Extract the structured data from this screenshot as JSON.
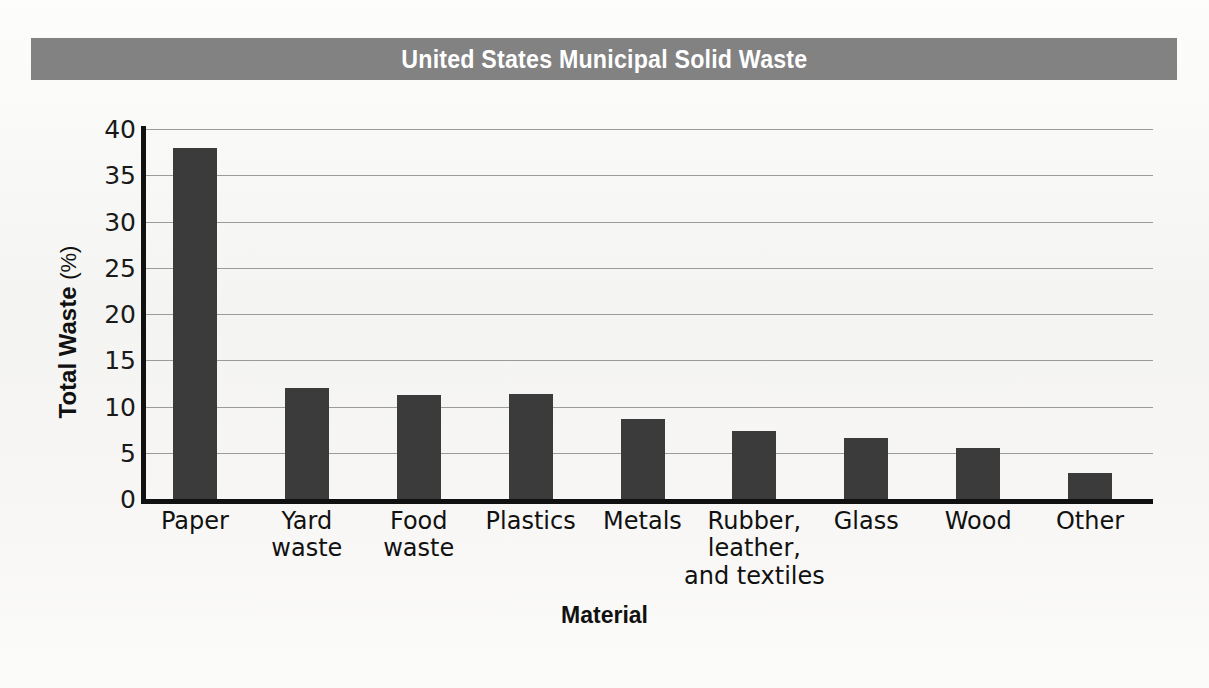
{
  "banner": {
    "title": "United States Municipal Solid Waste",
    "background_color": "#828282",
    "text_color": "#ffffff"
  },
  "axis_titles": {
    "y_main": "Total Waste",
    "y_unit": "(%)",
    "x": "Material"
  },
  "chart_data": {
    "type": "bar",
    "title": "United States Municipal Solid Waste",
    "xlabel": "Material",
    "ylabel": "Total Waste (%)",
    "ylim": [
      0,
      40
    ],
    "yticks": [
      0,
      5,
      10,
      15,
      20,
      25,
      30,
      35,
      40
    ],
    "ytick_labels": [
      "0",
      "5",
      "10",
      "15",
      "20",
      "25",
      "30",
      "35",
      "40"
    ],
    "grid": true,
    "grid_axis": "y",
    "legend": false,
    "bar_color": "#3b3b3b",
    "categories": [
      "Paper",
      "Yard\nwaste",
      "Food\nwaste",
      "Plastics",
      "Metals",
      "Rubber,\nleather,\nand textiles",
      "Glass",
      "Wood",
      "Other"
    ],
    "values": [
      38.0,
      12.0,
      11.2,
      11.3,
      8.6,
      7.4,
      6.6,
      5.5,
      2.8
    ]
  }
}
